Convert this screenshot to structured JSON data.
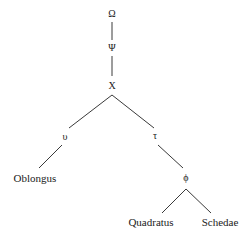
{
  "diagram": {
    "type": "stemma",
    "nodes": [
      {
        "id": "omega",
        "label": "Ω",
        "x": 112,
        "y": 14,
        "kind": "hyparchetype"
      },
      {
        "id": "psi",
        "label": "Ψ",
        "x": 112,
        "y": 48,
        "kind": "hyparchetype"
      },
      {
        "id": "chi",
        "label": "X",
        "x": 112,
        "y": 86,
        "kind": "hyparchetype"
      },
      {
        "id": "upsilon",
        "label": "υ",
        "x": 65,
        "y": 137,
        "kind": "hyparchetype"
      },
      {
        "id": "tau",
        "label": "τ",
        "x": 155,
        "y": 136,
        "kind": "hyparchetype"
      },
      {
        "id": "oblongus",
        "label": "Oblongus",
        "x": 35,
        "y": 178,
        "kind": "witness"
      },
      {
        "id": "phi",
        "label": "ϕ",
        "x": 186,
        "y": 178,
        "kind": "hyparchetype"
      },
      {
        "id": "quadratus",
        "label": "Quadratus",
        "x": 151,
        "y": 222,
        "kind": "witness"
      },
      {
        "id": "schedae",
        "label": "Schedae",
        "x": 220,
        "y": 222,
        "kind": "witness"
      }
    ],
    "edges": [
      {
        "from": "omega",
        "to": "psi",
        "x1": 112,
        "y1": 22,
        "x2": 112,
        "y2": 40
      },
      {
        "from": "psi",
        "to": "chi",
        "x1": 112,
        "y1": 56,
        "x2": 112,
        "y2": 76
      },
      {
        "from": "chi",
        "to": "upsilon",
        "x1": 112,
        "y1": 95,
        "x2": 69,
        "y2": 128
      },
      {
        "from": "chi",
        "to": "tau",
        "x1": 112,
        "y1": 95,
        "x2": 154,
        "y2": 128
      },
      {
        "from": "upsilon",
        "to": "oblongus",
        "x1": 62,
        "y1": 145,
        "x2": 39,
        "y2": 168
      },
      {
        "from": "tau",
        "to": "phi",
        "x1": 158,
        "y1": 145,
        "x2": 183,
        "y2": 168
      },
      {
        "from": "phi",
        "to": "quadratus",
        "x1": 186,
        "y1": 189,
        "x2": 162,
        "y2": 213
      },
      {
        "from": "phi",
        "to": "schedae",
        "x1": 186,
        "y1": 189,
        "x2": 211,
        "y2": 213
      }
    ]
  },
  "labels": {
    "omega": "Ω",
    "psi": "Ψ",
    "chi": "X",
    "upsilon": "υ",
    "tau": "τ",
    "oblongus": "Oblongus",
    "phi": "ϕ",
    "quadratus": "Quadratus",
    "schedae": "Schedae"
  }
}
